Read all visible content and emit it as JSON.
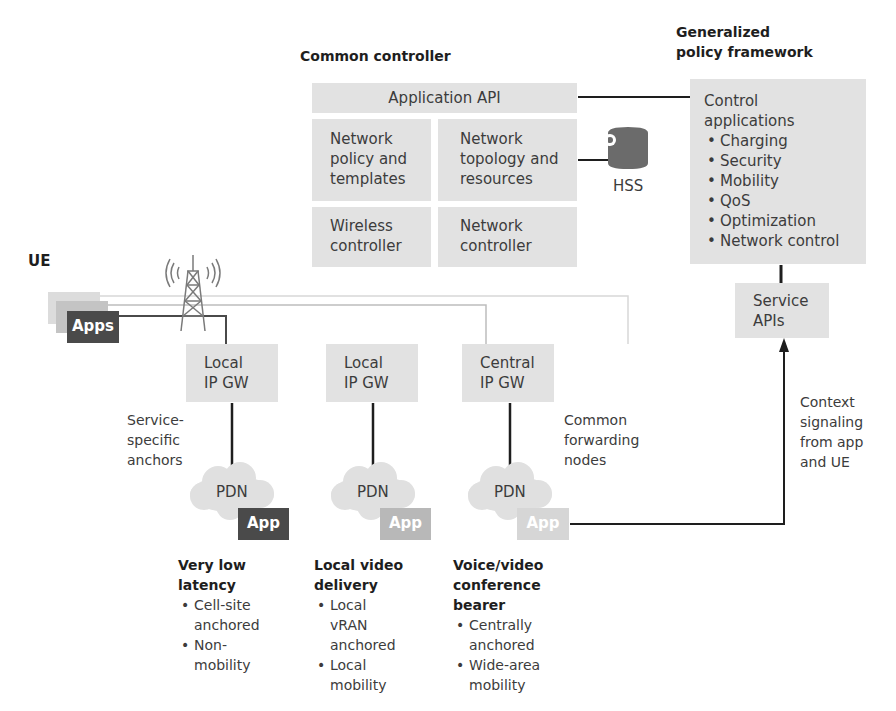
{
  "common_controller": {
    "title": "Common controller",
    "application_api": "Application API",
    "network_policy": [
      "Network",
      "policy and",
      "templates"
    ],
    "network_topology": [
      "Network",
      "topology and",
      "resources"
    ],
    "wireless_controller": [
      "Wireless",
      "controller"
    ],
    "network_controller": [
      "Network",
      "controller"
    ]
  },
  "hss": {
    "label": "HSS",
    "icon": "database-icon",
    "color": "#6b6b6b"
  },
  "policy_framework": {
    "title": [
      "Generalized",
      "policy framework"
    ],
    "control_applications": {
      "heading": [
        "Control",
        "applications"
      ],
      "items": [
        "Charging",
        "Security",
        "Mobility",
        "QoS",
        "Optimization",
        "Network control"
      ]
    },
    "service_apis": [
      "Service",
      "APIs"
    ]
  },
  "ue": {
    "label": "UE",
    "apps_label": "Apps",
    "tower_icon": "cell-tower-icon"
  },
  "gateways": [
    {
      "line1": "Local",
      "line2": "IP GW"
    },
    {
      "line1": "Local",
      "line2": "IP GW"
    },
    {
      "line1": "Central",
      "line2": "IP GW"
    }
  ],
  "annotations": {
    "service_specific": [
      "Service-",
      "specific",
      "anchors"
    ],
    "common_forwarding": [
      "Common",
      "forwarding",
      "nodes"
    ],
    "context_signaling": [
      "Context",
      "signaling",
      "from app",
      "and UE"
    ]
  },
  "pdns": [
    {
      "label": "PDN",
      "app": "App",
      "app_color": "#4a4a4a"
    },
    {
      "label": "PDN",
      "app": "App",
      "app_color": "#b8b8b8"
    },
    {
      "label": "PDN",
      "app": "App",
      "app_color": "#d6d6d6"
    }
  ],
  "use_cases": [
    {
      "title": [
        "Very low",
        "latency"
      ],
      "bullets": [
        [
          "Cell-site",
          "anchored"
        ],
        [
          "Non-",
          "mobility"
        ]
      ]
    },
    {
      "title": [
        "Local video",
        "delivery"
      ],
      "bullets": [
        [
          "Local",
          "vRAN",
          "anchored"
        ],
        [
          "Local",
          "mobility"
        ]
      ]
    },
    {
      "title": [
        "Voice/video",
        "conference",
        "bearer"
      ],
      "bullets": [
        [
          "Centrally",
          "anchored"
        ],
        [
          "Wide-area",
          "mobility"
        ]
      ]
    }
  ],
  "colors": {
    "box_fill": "#e2e2e2",
    "line_dark": "#1e1e1e",
    "ue_dark": "#4a4a4a",
    "ue_mid": "#c4c4c4",
    "ue_light": "#dcdcdc"
  }
}
